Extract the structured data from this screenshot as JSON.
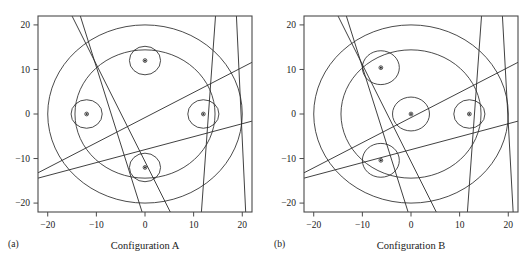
{
  "figure": {
    "background": "#ffffff",
    "line_color": "#2b2b2b",
    "frame_color": "#4a4a4a"
  },
  "panels": [
    {
      "id": "(a)",
      "caption": "Configuration A",
      "axes": {
        "xlim": [
          -22,
          22
        ],
        "ylim": [
          -22,
          22
        ],
        "xticks": [
          -20,
          -10,
          0,
          10,
          20
        ],
        "yticks": [
          -20,
          -10,
          0,
          10,
          20
        ],
        "xticklabels": [
          "−20",
          "−10",
          "0",
          "10",
          "20"
        ],
        "yticklabels": [
          "−20",
          "−10",
          "0",
          "10",
          "20"
        ]
      },
      "chart_data": {
        "type": "scatter",
        "title": "Configuration A",
        "xlabel": "Configuration A",
        "ylabel": "",
        "xlim": [
          -22,
          22
        ],
        "ylim": [
          -22,
          22
        ],
        "grid": false,
        "legend": "none",
        "outer_circles": [
          {
            "cx": 0,
            "cy": 0,
            "r": 20
          },
          {
            "cx": 0,
            "cy": 0,
            "r": 14.4
          }
        ],
        "small_circles": [
          {
            "cx": -12,
            "cy": 0,
            "r": 3.2
          },
          {
            "cx": 0,
            "cy": 12,
            "r": 3.2
          },
          {
            "cx": 12,
            "cy": 0,
            "r": 3.2
          },
          {
            "cx": 0,
            "cy": -12,
            "r": 3.2
          }
        ],
        "centers": [
          {
            "x": -12,
            "y": 0
          },
          {
            "x": 0,
            "y": 12
          },
          {
            "x": 12,
            "y": 0
          },
          {
            "x": 0,
            "y": -12
          }
        ],
        "lines": [
          {
            "x1": -15.0,
            "y1": 22.0,
            "x2": 5.2,
            "y2": -22.0
          },
          {
            "x1": -13.3,
            "y1": 22.0,
            "x2": -0.6,
            "y2": -22.0
          },
          {
            "x1": 14.5,
            "y1": 22.0,
            "x2": 11.6,
            "y2": -22.0
          },
          {
            "x1": 18.8,
            "y1": 22.0,
            "x2": 20.7,
            "y2": -22.0
          },
          {
            "x1": -22.0,
            "y1": -13.2,
            "x2": 22.0,
            "y2": 11.6
          },
          {
            "x1": -22.0,
            "y1": -14.4,
            "x2": 22.0,
            "y2": -1.6
          }
        ]
      }
    },
    {
      "id": "(b)",
      "caption": "Configuration B",
      "axes": {
        "xlim": [
          -22,
          22
        ],
        "ylim": [
          -22,
          22
        ],
        "xticks": [
          -20,
          -10,
          0,
          10,
          20
        ],
        "yticks": [
          -20,
          -10,
          0,
          10,
          20
        ],
        "xticklabels": [
          "−20",
          "−10",
          "0",
          "10",
          "20"
        ],
        "yticklabels": [
          "−20",
          "−10",
          "0",
          "10",
          "20"
        ]
      },
      "chart_data": {
        "type": "scatter",
        "title": "Configuration B",
        "xlabel": "Configuration B",
        "ylabel": "",
        "xlim": [
          -22,
          22
        ],
        "ylim": [
          -22,
          22
        ],
        "grid": false,
        "legend": "none",
        "outer_circles": [
          {
            "cx": 0,
            "cy": 0,
            "r": 20
          },
          {
            "cx": 0,
            "cy": 0,
            "r": 14.4
          }
        ],
        "small_circles": [
          {
            "cx": -6.2,
            "cy": 10.4,
            "r": 3.8
          },
          {
            "cx": 0,
            "cy": 0,
            "r": 3.8
          },
          {
            "cx": 12,
            "cy": 0,
            "r": 3.2
          },
          {
            "cx": -6.2,
            "cy": -10.4,
            "r": 3.8
          }
        ],
        "centers": [
          {
            "x": -6.2,
            "y": 10.4
          },
          {
            "x": 0,
            "y": 0
          },
          {
            "x": 12,
            "y": 0
          },
          {
            "x": -6.2,
            "y": -10.4
          }
        ],
        "lines": [
          {
            "x1": -15.0,
            "y1": 22.0,
            "x2": 5.2,
            "y2": -22.0
          },
          {
            "x1": -13.3,
            "y1": 22.0,
            "x2": -0.6,
            "y2": -22.0
          },
          {
            "x1": 14.5,
            "y1": 22.0,
            "x2": 11.6,
            "y2": -22.0
          },
          {
            "x1": 18.8,
            "y1": 22.0,
            "x2": 21.0,
            "y2": -22.0
          },
          {
            "x1": -22.0,
            "y1": -13.2,
            "x2": 22.0,
            "y2": 11.6
          },
          {
            "x1": -22.0,
            "y1": -14.4,
            "x2": 22.0,
            "y2": -1.6
          }
        ]
      }
    }
  ]
}
